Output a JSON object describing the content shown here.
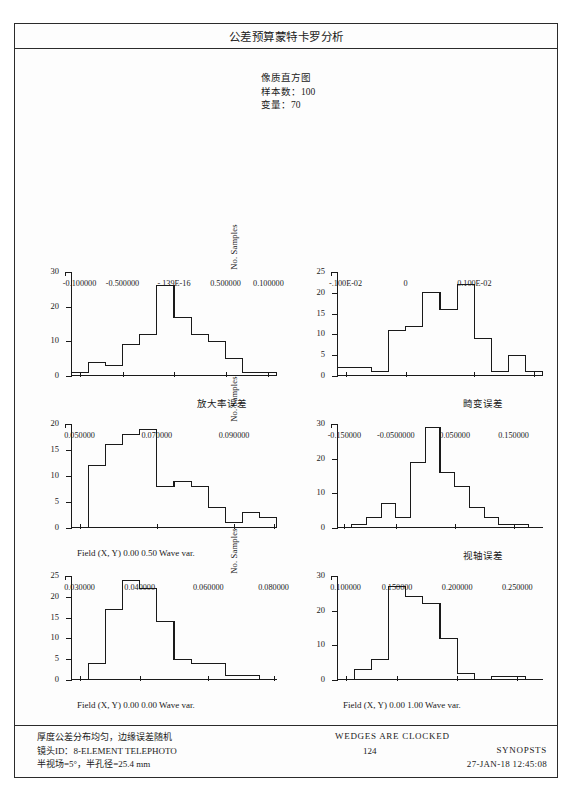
{
  "header": {
    "title": "公差预算蒙特卡罗分析",
    "subtitle_lines": [
      "像质直方图",
      "样本数：100",
      "变量：70"
    ]
  },
  "axis_label_y": "No. Samples",
  "footer": {
    "left_lines": [
      "厚度公差分布均匀，边缘误差随机",
      "镜头ID：8-ELEMENT TELEPHOTO",
      "半视场=5°，半孔径=25.4 mm"
    ],
    "center_note": "WEDGES ARE CLOCKED",
    "page_number": "124",
    "brand": "SYNOPSTS",
    "timestamp": "27-JAN-18 12:45:08"
  },
  "chart_data": [
    {
      "type": "bar",
      "id": "magnification-error",
      "title": "",
      "xlabel": "放大率误差",
      "ylabel": "No. Samples",
      "ylim": [
        0,
        30
      ],
      "yticks": [
        0,
        10,
        20,
        30
      ],
      "xlim": [
        0,
        12
      ],
      "xtick_positions": [
        0.5,
        3.0,
        6.0,
        9.0,
        11.5
      ],
      "xticklabels": [
        "-0.100000",
        "-0.500000",
        "-.139E-16",
        "0.500000",
        "0.100000"
      ],
      "values": [
        1,
        4,
        3,
        9,
        12,
        26,
        17,
        12,
        10,
        5,
        1,
        1
      ],
      "grid": false
    },
    {
      "type": "bar",
      "id": "distortion-error",
      "title": "",
      "xlabel": "畸变误差",
      "ylabel": "No. Samples",
      "ylim": [
        0,
        25
      ],
      "yticks": [
        0,
        5,
        10,
        15,
        20,
        25
      ],
      "xlim": [
        0,
        12
      ],
      "xtick_positions": [
        0.5,
        4.0,
        8.0,
        11.5
      ],
      "xticklabels": [
        "-.100E-02",
        "0",
        "0.100E-02",
        ""
      ],
      "values": [
        2,
        2,
        1,
        11,
        12,
        20,
        16,
        22,
        9,
        1,
        5,
        1
      ],
      "grid": false
    },
    {
      "type": "bar",
      "id": "wave-var-field-0-050",
      "title": "",
      "xlabel": "Field (X, Y) 0.00  0.50 Wave var.",
      "ylabel": "No. Samples",
      "ylim": [
        0,
        20
      ],
      "yticks": [
        0,
        5,
        10,
        15,
        20
      ],
      "xlim": [
        0,
        12
      ],
      "xtick_positions": [
        0.5,
        5.0,
        9.5,
        11.8
      ],
      "xticklabels": [
        "0.050000",
        "0.070000",
        "0.090000",
        ""
      ],
      "values": [
        0,
        12,
        16,
        18,
        19,
        8,
        9,
        8,
        4,
        1,
        3,
        2
      ],
      "grid": false
    },
    {
      "type": "bar",
      "id": "axis-error",
      "title": "",
      "xlabel": "视轴误差",
      "ylabel": "No. Samples",
      "ylim": [
        0,
        30
      ],
      "yticks": [
        0,
        10,
        20,
        30
      ],
      "xlim": [
        0,
        14
      ],
      "xtick_positions": [
        0.5,
        4.0,
        8.0,
        12.0
      ],
      "xticklabels": [
        "-0.150000",
        "-0.0500000",
        "0.050000",
        "0.150000"
      ],
      "values": [
        0,
        1,
        3,
        7,
        3,
        19,
        29,
        16,
        12,
        6,
        3,
        1,
        1,
        0
      ],
      "grid": false
    },
    {
      "type": "bar",
      "id": "wave-var-field-0-000",
      "title": "",
      "xlabel": "Field (X, Y) 0.00  0.00 Wave var.",
      "ylabel": "No. Samples",
      "ylim": [
        0,
        25
      ],
      "yticks": [
        0,
        5,
        10,
        15,
        20,
        25
      ],
      "xlim": [
        0,
        12
      ],
      "xtick_positions": [
        0.5,
        4.0,
        8.0,
        11.8
      ],
      "xticklabels": [
        "0.030000",
        "0.040000",
        "0.060000",
        "0.080000"
      ],
      "values": [
        0,
        4,
        17,
        24,
        22,
        14,
        5,
        4,
        4,
        1,
        1,
        0
      ],
      "grid": false
    },
    {
      "type": "bar",
      "id": "wave-var-field-1-000",
      "title": "",
      "xlabel": "Field (X, Y) 0.00  1.00 Wave var.",
      "ylabel": "No. Samples",
      "ylim": [
        0,
        30
      ],
      "yticks": [
        0,
        10,
        20,
        30
      ],
      "xlim": [
        0,
        12
      ],
      "xtick_positions": [
        0.5,
        3.5,
        7.0,
        10.5
      ],
      "xticklabels": [
        "0.100000",
        "0.150000",
        "0.200000",
        "0.250000"
      ],
      "values": [
        0,
        3,
        6,
        27,
        24,
        22,
        12,
        2,
        0,
        1,
        1,
        0
      ],
      "grid": false
    }
  ]
}
